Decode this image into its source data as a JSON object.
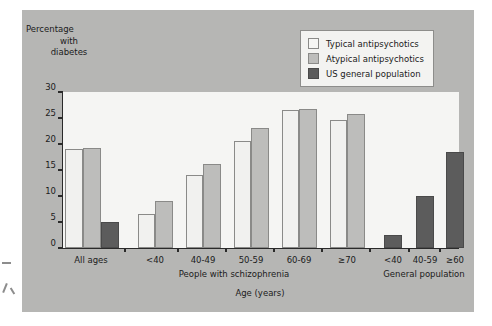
{
  "chart_data": {
    "type": "bar",
    "title": "",
    "ylabel": "Percentage with diabetes",
    "ylabel_lines": [
      "Percentage",
      "with",
      "diabetes"
    ],
    "xlabel": "Age (years)",
    "ylim": [
      0,
      30
    ],
    "yticks": [
      0,
      5,
      10,
      15,
      20,
      25,
      30
    ],
    "ytick_labels": [
      "0",
      "5",
      "10",
      "15",
      "20",
      "25",
      "30"
    ],
    "grid": false,
    "legend_position": "top-right",
    "categories": [
      "All ages",
      "<40",
      "40-49",
      "50-59",
      "60-69",
      "≥70",
      "<40",
      "40-59",
      "≥60"
    ],
    "group_captions": [
      "People with schizophrenia",
      "General population"
    ],
    "series": [
      {
        "name": "Typical antipsychotics",
        "color": "#f1f1ef",
        "values": [
          19.0,
          6.6,
          14.0,
          20.5,
          26.6,
          24.7,
          null,
          null,
          null
        ]
      },
      {
        "name": "Atypical antipsychotics",
        "color": "#bdbdbb",
        "values": [
          19.3,
          9.1,
          16.2,
          23.0,
          26.7,
          25.8,
          null,
          null,
          null
        ]
      },
      {
        "name": "US general population",
        "color": "#5c5c5c",
        "values": [
          5.0,
          null,
          null,
          null,
          null,
          null,
          2.5,
          10.0,
          18.5
        ]
      }
    ],
    "bars": [
      {
        "group": 0,
        "series": "Typical antipsychotics",
        "category": "All ages",
        "value": 19.0
      },
      {
        "group": 0,
        "series": "Atypical antipsychotics",
        "category": "All ages",
        "value": 19.3
      },
      {
        "group": 0,
        "series": "US general population",
        "category": "All ages",
        "value": 5.0
      },
      {
        "group": 1,
        "series": "Typical antipsychotics",
        "category": "<40",
        "value": 6.6
      },
      {
        "group": 1,
        "series": "Atypical antipsychotics",
        "category": "<40",
        "value": 9.1
      },
      {
        "group": 2,
        "series": "Typical antipsychotics",
        "category": "40-49",
        "value": 14.0
      },
      {
        "group": 2,
        "series": "Atypical antipsychotics",
        "category": "40-49",
        "value": 16.2
      },
      {
        "group": 3,
        "series": "Typical antipsychotics",
        "category": "50-59",
        "value": 20.5
      },
      {
        "group": 3,
        "series": "Atypical antipsychotics",
        "category": "50-59",
        "value": 23.0
      },
      {
        "group": 4,
        "series": "Typical antipsychotics",
        "category": "60-69",
        "value": 26.6
      },
      {
        "group": 4,
        "series": "Atypical antipsychotics",
        "category": "60-69",
        "value": 26.7
      },
      {
        "group": 5,
        "series": "Typical antipsychotics",
        "category": "≥70",
        "value": 24.7
      },
      {
        "group": 5,
        "series": "Atypical antipsychotics",
        "category": "≥70",
        "value": 25.8
      },
      {
        "group": 6,
        "series": "US general population",
        "category": "<40",
        "value": 2.5
      },
      {
        "group": 7,
        "series": "US general population",
        "category": "40-59",
        "value": 10.0
      },
      {
        "group": 8,
        "series": "US general population",
        "category": "≥60",
        "value": 18.5
      }
    ]
  },
  "legend": {
    "items": [
      {
        "label": "Typical antipsychotics",
        "swatch": "typ"
      },
      {
        "label": "Atypical antipsychotics",
        "swatch": "aty"
      },
      {
        "label": "US general population",
        "swatch": "us"
      }
    ]
  },
  "colors": {
    "panel": "#b6b6b4",
    "plot_background": "#f5f5f3",
    "axis": "#2a2a2a",
    "typical": "#f1f1ef",
    "atypical": "#bdbdbb",
    "us_general": "#5c5c5c"
  }
}
